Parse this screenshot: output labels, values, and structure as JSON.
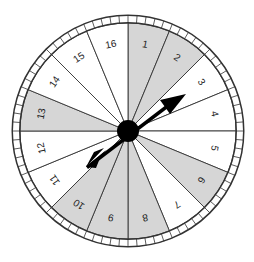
{
  "spinner": {
    "sectors": [
      {
        "label": "1",
        "shaded": true
      },
      {
        "label": "2",
        "shaded": true
      },
      {
        "label": "3",
        "shaded": false
      },
      {
        "label": "4",
        "shaded": false
      },
      {
        "label": "5",
        "shaded": false
      },
      {
        "label": "6",
        "shaded": true
      },
      {
        "label": "7",
        "shaded": false
      },
      {
        "label": "8",
        "shaded": true
      },
      {
        "label": "9",
        "shaded": true
      },
      {
        "label": "10",
        "shaded": true
      },
      {
        "label": "11",
        "shaded": false
      },
      {
        "label": "12",
        "shaded": false
      },
      {
        "label": "13",
        "shaded": true
      },
      {
        "label": "14",
        "shaded": false
      },
      {
        "label": "15",
        "shaded": false
      },
      {
        "label": "16",
        "shaded": false
      }
    ],
    "pointer_points_to": "3",
    "colors": {
      "shaded": "#d6d6d6",
      "unshaded": "#ffffff",
      "line": "#333333",
      "hub": "#000000"
    }
  }
}
